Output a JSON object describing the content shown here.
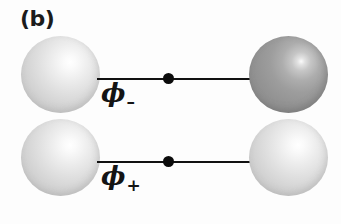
{
  "figure": {
    "panel_label": "(b)",
    "background_color": "#fdfdfd",
    "width": 341,
    "height": 224
  },
  "colors": {
    "sphere_light": "#d8d8d8",
    "sphere_light_highlight": "#ffffff",
    "sphere_dark": "#969696",
    "sphere_dark_highlight": "#fbfbfb",
    "bond_line": "#111111",
    "midpoint_dot": "#0b0b0b",
    "text": "#141414"
  },
  "rows": [
    {
      "name": "phi-minus",
      "label_symbol": "ϕ",
      "label_subscript": "–",
      "label_full": "ϕ–",
      "left_sphere": {
        "name": "left-atom-sphere",
        "shade": "light",
        "color": "#d8d8d8"
      },
      "right_sphere": {
        "name": "right-atom-sphere",
        "shade": "dark",
        "color": "#969696"
      },
      "bond": {
        "name": "bond-line",
        "midpoint_marker": true
      }
    },
    {
      "name": "phi-plus",
      "label_symbol": "ϕ",
      "label_subscript": "+",
      "label_full": "ϕ+",
      "left_sphere": {
        "name": "left-atom-sphere",
        "shade": "light",
        "color": "#d8d8d8"
      },
      "right_sphere": {
        "name": "right-atom-sphere",
        "shade": "light",
        "color": "#d8d8d8"
      },
      "bond": {
        "name": "bond-line",
        "midpoint_marker": true
      }
    }
  ]
}
